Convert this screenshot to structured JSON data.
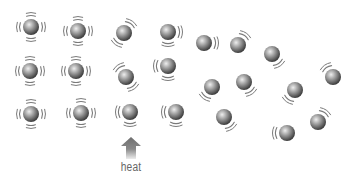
{
  "diagram": {
    "label_heat": "heat",
    "colors": {
      "ball_highlight": "#e8e8e8",
      "ball_mid": "#9a9a9a",
      "ball_shadow": "#4a4a4a",
      "motion_lines": "#7a7a7a",
      "arrow_top": "#6e6e6e",
      "arrow_bottom": "#e6e6e6"
    },
    "ball_radius": 8,
    "stages": [
      {
        "name": "solid",
        "particles": [
          {
            "x": 31,
            "y": 27,
            "motion": "vibrate"
          },
          {
            "x": 78,
            "y": 31,
            "motion": "vibrate"
          },
          {
            "x": 30,
            "y": 71,
            "motion": "vibrate"
          },
          {
            "x": 76,
            "y": 71,
            "motion": "vibrate"
          },
          {
            "x": 31,
            "y": 114,
            "motion": "vibrate"
          },
          {
            "x": 81,
            "y": 113,
            "motion": "vibrate"
          }
        ]
      },
      {
        "name": "liquid",
        "particles": [
          {
            "x": 124,
            "y": 33,
            "motion": "diag-ne-sw"
          },
          {
            "x": 168,
            "y": 32,
            "motion": "right-bottom"
          },
          {
            "x": 126,
            "y": 77,
            "motion": "diag-nw-se"
          },
          {
            "x": 168,
            "y": 66,
            "motion": "left-bottom"
          },
          {
            "x": 130,
            "y": 112,
            "motion": "left-bottom"
          },
          {
            "x": 176,
            "y": 112,
            "motion": "left-bottom"
          }
        ]
      },
      {
        "name": "gas",
        "particles": [
          {
            "x": 204,
            "y": 43,
            "motion": "right"
          },
          {
            "x": 238,
            "y": 45,
            "motion": "top-right"
          },
          {
            "x": 212,
            "y": 87,
            "motion": "bottom-left"
          },
          {
            "x": 244,
            "y": 82,
            "motion": "bottom-right"
          },
          {
            "x": 224,
            "y": 117,
            "motion": "bottom-right"
          },
          {
            "x": 272,
            "y": 54,
            "motion": "bottom-right"
          },
          {
            "x": 295,
            "y": 90,
            "motion": "bottom-left"
          },
          {
            "x": 333,
            "y": 77,
            "motion": "top-left"
          },
          {
            "x": 318,
            "y": 122,
            "motion": "top-right"
          },
          {
            "x": 287,
            "y": 133,
            "motion": "left"
          }
        ]
      }
    ],
    "arrow": {
      "x": 131,
      "top": 137,
      "bottom": 159,
      "direction": "up"
    }
  }
}
